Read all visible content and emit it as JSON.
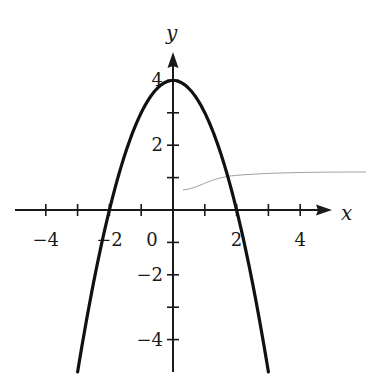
{
  "chart_data": {
    "type": "line",
    "title": "",
    "function": "y = 4 - x^2",
    "xlabel": "x",
    "ylabel": "y",
    "xlim": [
      -5,
      5
    ],
    "ylim": [
      -5,
      5
    ],
    "grid": false,
    "legend": null,
    "x_ticks": [
      -4,
      -3,
      -2,
      -1,
      1,
      2,
      3,
      4
    ],
    "x_tick_labels": [
      {
        "value": -4,
        "label": "−4"
      },
      {
        "value": -2,
        "label": "−2"
      },
      {
        "value": 0,
        "label": "0"
      },
      {
        "value": 2,
        "label": "2"
      },
      {
        "value": 4,
        "label": "4"
      }
    ],
    "y_ticks": [
      -4,
      -3,
      -2,
      -1,
      1,
      2,
      3,
      4
    ],
    "y_tick_labels": [
      {
        "value": 4,
        "label": "4"
      },
      {
        "value": 2,
        "label": "2"
      },
      {
        "value": -2,
        "label": "−2"
      },
      {
        "value": -4,
        "label": "−4"
      }
    ],
    "series": [
      {
        "name": "parabola",
        "x": [
          -3,
          -2.5,
          -2,
          -1.5,
          -1,
          -0.5,
          0,
          0.5,
          1,
          1.5,
          2,
          2.5,
          3
        ],
        "y": [
          -5,
          -2.25,
          0,
          1.75,
          3,
          3.75,
          4,
          3.75,
          3,
          1.75,
          0,
          -2.25,
          -5
        ]
      }
    ],
    "key_points": {
      "vertex": [
        0,
        4
      ],
      "x_intercepts": [
        [
          -2,
          0
        ],
        [
          2,
          0
        ]
      ],
      "y_intercept": [
        0,
        4
      ]
    },
    "colors": {
      "curve": "#111111",
      "axes": "#1a1a1a",
      "artifact": "#9a9a9a"
    }
  }
}
